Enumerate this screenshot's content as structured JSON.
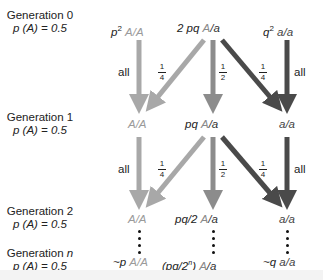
{
  "generations": [
    {
      "title": "Generation 0",
      "freq_label": "p (A) = 0.5"
    },
    {
      "title": "Generation 1",
      "freq_label": "p (A) = 0.5"
    },
    {
      "title": "Generation 2",
      "freq_label": "p (A) = 0.5"
    },
    {
      "title": "Generation ",
      "title_n": "n",
      "freq_label": "p (A) = 0.5"
    }
  ],
  "rows": [
    {
      "AA_coef": "p",
      "AA_sup": "2",
      "AA": "A/A",
      "Aa_coef": "2 pq",
      "Aa_A": "A",
      "Aa_a": "/a",
      "aa_coef": "q",
      "aa_sup": "2",
      "aa": "a/a"
    },
    {
      "AA_coef": "",
      "AA": "A/A",
      "Aa_coef": "pq",
      "Aa_A": "A",
      "Aa_a": "/a",
      "aa_coef": "",
      "aa": "a/a"
    },
    {
      "AA_coef": "",
      "AA": "A/A",
      "Aa_coef": "pq/2",
      "Aa_A": "A",
      "Aa_a": "/a",
      "aa_coef": "",
      "aa": "a/a"
    },
    {
      "AA_coef": "~p",
      "AA": "A/A",
      "Aa_coef": "(pq/2",
      "Aa_sup": "n",
      "Aa_close": ")",
      "Aa_A": "A",
      "Aa_a": "/a",
      "aa_coef": "~q",
      "aa": "a/a"
    }
  ],
  "transitions": {
    "all_label": "all",
    "quarter": {
      "num": "1",
      "den": "4"
    },
    "half": {
      "num": "1",
      "den": "2"
    }
  },
  "colors": {
    "AA_arrow": "#a8a8a8",
    "Aa_arrow": "#8c8c8c",
    "aa_arrow": "#4a4a4a"
  }
}
